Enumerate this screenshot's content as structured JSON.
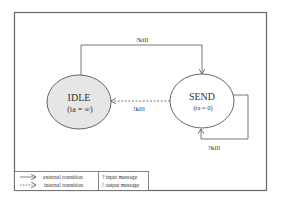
{
  "diagram": {
    "type": "state-machine",
    "states": [
      {
        "id": "idle",
        "name": "IDLE",
        "time_advance": "(ta = ∞)",
        "fill": "#e6e6e6"
      },
      {
        "id": "send",
        "name": "SEND",
        "time_advance": "(ta = 0)",
        "fill": "#ffffff"
      }
    ],
    "transitions": [
      {
        "from": "idle",
        "to": "send",
        "kind": "external",
        "label": "?kill"
      },
      {
        "from": "send",
        "to": "idle",
        "kind": "internal",
        "label": "!kill"
      },
      {
        "from": "send",
        "to": "send",
        "kind": "external",
        "label": "?kill"
      }
    ],
    "legend": {
      "external": "external transition",
      "internal": "internal transition",
      "input": "? input message",
      "output": "! output message"
    },
    "colors": {
      "stroke": "#555555",
      "frame": "#666666",
      "idle_fill": "#e6e6e6",
      "text": "#333333"
    }
  }
}
